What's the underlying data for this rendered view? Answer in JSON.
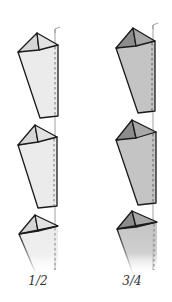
{
  "diagram": {
    "columns": [
      {
        "label": "1/2",
        "shade": "light",
        "colors": {
          "body": "#ebebeb",
          "top_left": "#d6d6d6",
          "top_right": "#e2e2e2"
        },
        "piece_count": 3
      },
      {
        "label": "3/4",
        "shade": "dark",
        "colors": {
          "body": "#c4c4c4",
          "top_left": "#8c8c8c",
          "top_right": "#a8a8a8"
        },
        "piece_count": 3
      }
    ],
    "stroke_color": "#1a1a1a",
    "guide_line_color": "#888888"
  }
}
